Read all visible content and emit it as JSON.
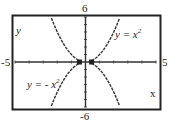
{
  "chart_data": {
    "type": "line",
    "title": "",
    "xlabel": "x",
    "ylabel": "y",
    "xlim": [
      -5,
      5
    ],
    "ylim": [
      -6,
      6
    ],
    "xticks_labeled": [
      "-5",
      "5"
    ],
    "yticks_labeled": [
      "6",
      "-6"
    ],
    "tick_spacing": 1,
    "grid": false,
    "series": [
      {
        "name": "y = x^2",
        "label": "y = x²",
        "function": "x^2",
        "x": [
          -2.4,
          -2,
          -1.5,
          -1,
          -0.5,
          0,
          0.5,
          1,
          1.5,
          2,
          2.4
        ],
        "y": [
          5.76,
          4,
          2.25,
          1,
          0.25,
          0,
          0.25,
          1,
          2.25,
          4,
          5.76
        ]
      },
      {
        "name": "y = -x^2",
        "label": "y = - x²",
        "function": "-x^2",
        "x": [
          -2.4,
          -2,
          -1.5,
          -1,
          -0.5,
          0,
          0.5,
          1,
          1.5,
          2,
          2.4
        ],
        "y": [
          -5.76,
          -4,
          -2.25,
          -1,
          -0.25,
          0,
          -0.25,
          -1,
          -2.25,
          -4,
          -5.76
        ]
      }
    ],
    "markers": [
      {
        "x": -0.43,
        "y": 0
      },
      {
        "x": 0.43,
        "y": 0
      }
    ]
  },
  "labels": {
    "ymax": "6",
    "ymin": "-6",
    "xmin": "-5",
    "xmax": "5",
    "yaxis": "y",
    "xaxis": "x",
    "curve_upper": "y = x",
    "curve_lower": "y = - x",
    "exp": "2"
  }
}
